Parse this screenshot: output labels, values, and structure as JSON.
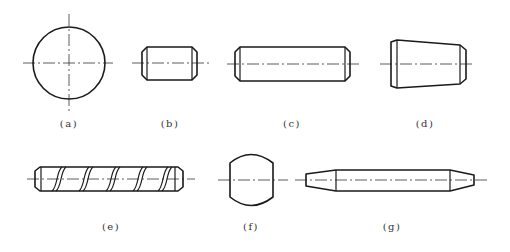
{
  "figure": {
    "colors": {
      "line": "#1a1a1a",
      "centerline": "#333333",
      "background": "#ffffff"
    },
    "parts": [
      {
        "id": "a",
        "label": "(a)",
        "shape": "circle-end-view"
      },
      {
        "id": "b",
        "label": "(b)",
        "shape": "short-cylindrical-pin-chamfered"
      },
      {
        "id": "c",
        "label": "(c)",
        "shape": "long-cylindrical-pin-chamfered"
      },
      {
        "id": "d",
        "label": "(d)",
        "shape": "tapered-pin"
      },
      {
        "id": "e",
        "label": "(e)",
        "shape": "spiral-grooved-pin"
      },
      {
        "id": "f",
        "label": "(f)",
        "shape": "barrel-roller"
      },
      {
        "id": "g",
        "label": "(g)",
        "shape": "double-tapered-pin"
      }
    ]
  }
}
